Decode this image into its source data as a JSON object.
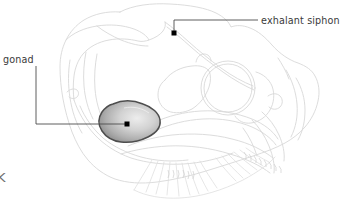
{
  "figure": {
    "type": "anatomical-line-diagram",
    "background_color": "#ffffff",
    "outline_color": "#d9d9d9",
    "detail_color": "#e2e2e2",
    "leader_color": "#4d4d4d",
    "marker_color": "#000000",
    "text_color": "#3a3a3a",
    "gonad_fill_light": "#e8e8e8",
    "gonad_fill_mid": "#b9b9b9",
    "gonad_fill_dark": "#8a8a8a",
    "gonad_stroke": "#4a4a4a"
  },
  "labels": {
    "gonad": {
      "text": "gonad",
      "marker_x": 127,
      "marker_y": 124
    },
    "exhalant_siphon": {
      "text": "exhalant siphon",
      "marker_x": 174,
      "marker_y": 33
    }
  },
  "corner": {
    "mark": "K"
  }
}
